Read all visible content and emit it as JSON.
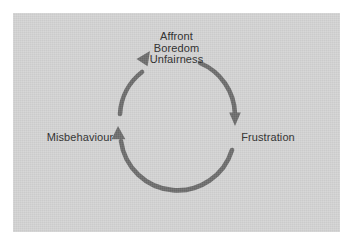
{
  "diagram": {
    "type": "cycle",
    "title": "",
    "background_color": "#d3d3d3",
    "page_color": "#ffffff",
    "arrow_color": "#6b6b6b",
    "text_color": "#2a2a2a",
    "nodes": [
      {
        "id": "trigger",
        "position": "top",
        "lines": [
          "Affront",
          "Boredom",
          "Unfairness"
        ],
        "line1": "Affront",
        "line2": "Boredom",
        "line3": "Unfairness"
      },
      {
        "id": "frustration",
        "position": "right",
        "label": "Frustration"
      },
      {
        "id": "misbehaviour",
        "position": "left",
        "label": "Misbehaviour"
      }
    ],
    "arrows": [
      {
        "id": "arrow-trigger-to-frustration",
        "from": "trigger",
        "to": "frustration",
        "direction": "clockwise"
      },
      {
        "id": "arrow-frustration-to-misbehaviour",
        "from": "frustration",
        "to": "misbehaviour",
        "direction": "clockwise"
      },
      {
        "id": "arrow-misbehaviour-to-trigger",
        "from": "misbehaviour",
        "to": "trigger",
        "direction": "clockwise"
      }
    ]
  }
}
